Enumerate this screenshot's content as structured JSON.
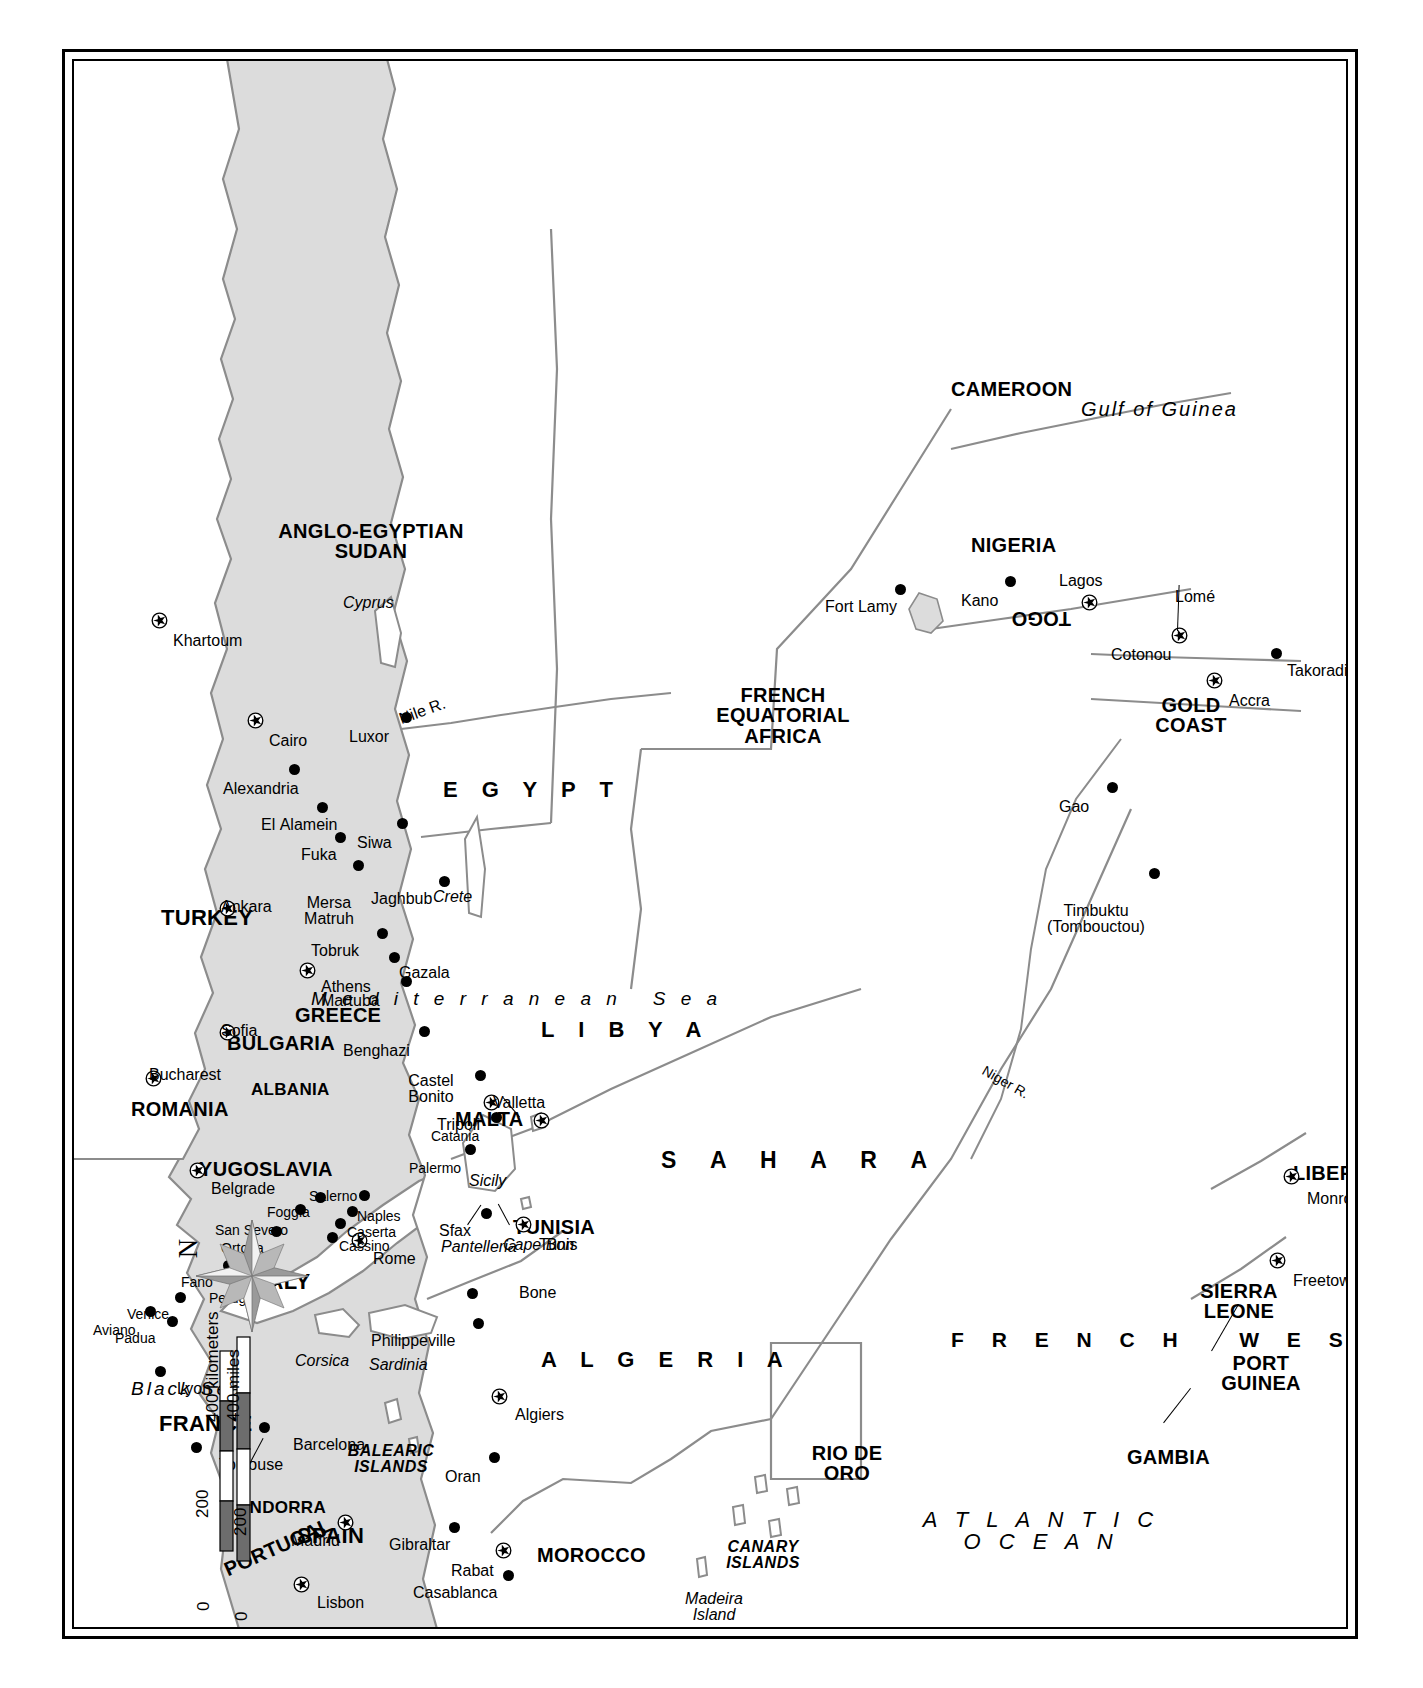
{
  "map": {
    "title": "North Africa and the Mediterranean Theater",
    "orientation": "rotated 90 degrees counter-clockwise on page",
    "colors": {
      "water": "#dcdcdc",
      "land": "#ffffff",
      "border_line": "#8c8c8c",
      "coast_line": "#8c8c8c",
      "frame": "#000000",
      "ink": "#000000"
    },
    "compass": {
      "north_label": "N",
      "icon": "compass-rose-icon"
    },
    "scale": {
      "km_label": "400 kilometers",
      "km_ticks": [
        "0",
        "200",
        "400"
      ],
      "mi_label": "400 miles",
      "mi_ticks": [
        "0",
        "200",
        "400"
      ]
    },
    "water_bodies": [
      {
        "name": "Black Sea"
      },
      {
        "name": "M e d i t e r r a n e a n   S e a"
      },
      {
        "name": "ATLANTIC OCEAN"
      },
      {
        "name": "Gulf of Guinea"
      },
      {
        "name": "Nile R."
      },
      {
        "name": "Niger R."
      }
    ],
    "deserts": [
      {
        "name": "S A H A R A"
      }
    ],
    "countries": [
      {
        "name": "TURKEY"
      },
      {
        "name": "ROMANIA"
      },
      {
        "name": "BULGARIA"
      },
      {
        "name": "YUGOSLAVIA"
      },
      {
        "name": "ALBANIA"
      },
      {
        "name": "GREECE"
      },
      {
        "name": "ITALY"
      },
      {
        "name": "MALTA"
      },
      {
        "name": "TUNISIA"
      },
      {
        "name": "FRANCE"
      },
      {
        "name": "ANDORRA"
      },
      {
        "name": "SPAIN"
      },
      {
        "name": "PORTUGAL"
      },
      {
        "name": "MOROCCO"
      },
      {
        "name": "ALGERIA"
      },
      {
        "name": "LIBYA"
      },
      {
        "name": "EGYPT"
      },
      {
        "name": "ANGLO-EGYPTIAN SUDAN"
      },
      {
        "name": "FRENCH EQUATORIAL AFRICA"
      },
      {
        "name": "CAMEROON"
      },
      {
        "name": "NIGERIA"
      },
      {
        "name": "FRENCH WEST AFRICA"
      },
      {
        "name": "RIO DE ORO"
      },
      {
        "name": "GAMBIA"
      },
      {
        "name": "PORT GUINEA"
      },
      {
        "name": "SIERRA LEONE"
      },
      {
        "name": "LIBERIA"
      },
      {
        "name": "GOLD COAST"
      },
      {
        "name": "TOGO"
      }
    ],
    "islands": [
      {
        "name": "Cyprus"
      },
      {
        "name": "Crete"
      },
      {
        "name": "Sicily"
      },
      {
        "name": "Corsica"
      },
      {
        "name": "Sardinia"
      },
      {
        "name": "BALEARIC ISLANDS"
      },
      {
        "name": "Pantelleria"
      },
      {
        "name": "Cape Bon"
      },
      {
        "name": "Madeira Island"
      },
      {
        "name": "CANARY ISLANDS"
      }
    ],
    "capitals": [
      {
        "name": "Ankara"
      },
      {
        "name": "Bucharest"
      },
      {
        "name": "Sofia"
      },
      {
        "name": "Belgrade"
      },
      {
        "name": "Athens"
      },
      {
        "name": "Rome"
      },
      {
        "name": "Valletta"
      },
      {
        "name": "Tunis"
      },
      {
        "name": "Algiers"
      },
      {
        "name": "Madrid"
      },
      {
        "name": "Lisbon"
      },
      {
        "name": "Rabat"
      },
      {
        "name": "Tripoli"
      },
      {
        "name": "Cairo"
      },
      {
        "name": "Khartoum"
      },
      {
        "name": "Lagos"
      },
      {
        "name": "Cotonou"
      },
      {
        "name": "Lomé"
      },
      {
        "name": "Accra"
      },
      {
        "name": "Freetown"
      },
      {
        "name": "Monrovia"
      }
    ],
    "cities": [
      {
        "name": "Alexandria"
      },
      {
        "name": "El Alamein"
      },
      {
        "name": "Fuka"
      },
      {
        "name": "Mersa Matruh"
      },
      {
        "name": "Siwa"
      },
      {
        "name": "Tobruk"
      },
      {
        "name": "Gazala"
      },
      {
        "name": "Martuba"
      },
      {
        "name": "Jaghbub"
      },
      {
        "name": "Benghazi"
      },
      {
        "name": "Castel Bonito"
      },
      {
        "name": "Luxor"
      },
      {
        "name": "Sfax"
      },
      {
        "name": "Bone"
      },
      {
        "name": "Philippeville"
      },
      {
        "name": "Oran"
      },
      {
        "name": "Barcelona"
      },
      {
        "name": "Toulouse"
      },
      {
        "name": "Lyon"
      },
      {
        "name": "Gibraltar"
      },
      {
        "name": "Casablanca"
      },
      {
        "name": "Aviano"
      },
      {
        "name": "Padua"
      },
      {
        "name": "Venice"
      },
      {
        "name": "Fano"
      },
      {
        "name": "Perugia"
      },
      {
        "name": "Ortona"
      },
      {
        "name": "San Severo"
      },
      {
        "name": "Foggia"
      },
      {
        "name": "Salerno"
      },
      {
        "name": "Naples"
      },
      {
        "name": "Caserta"
      },
      {
        "name": "Cassino"
      },
      {
        "name": "Palermo"
      },
      {
        "name": "Catania"
      },
      {
        "name": "Fort Lamy"
      },
      {
        "name": "Kano"
      },
      {
        "name": "Gao"
      },
      {
        "name": "Timbuktu (Tombouctou)"
      },
      {
        "name": "Takoradi"
      }
    ],
    "labels": {
      "black_sea": "Black Sea",
      "med_sea": "M e d i t e r r a n e a n   S e a",
      "atlantic": "A T L A N T I C\nO C E A N",
      "gulf_guinea": "Gulf of Guinea",
      "nile": "Nile R.",
      "niger": "Niger R.",
      "sahara": "S A H A R A",
      "turkey": "TURKEY",
      "romania": "ROMANIA",
      "bulgaria": "BULGARIA",
      "yugoslavia": "YUGOSLAVIA",
      "albania": "ALBANIA",
      "greece": "GREECE",
      "italy": "ITALY",
      "malta": "MALTA",
      "tunisia": "TUNISIA",
      "france": "FRANCE",
      "andorra": "ANDORRA",
      "spain": "SPAIN",
      "portugal": "PORTUGAL",
      "morocco": "MOROCCO",
      "algeria": "A L G E R I A",
      "libya": "L I B Y A",
      "egypt": "E G Y P T",
      "sudan": "ANGLO-EGYPTIAN\nSUDAN",
      "fea": "FRENCH\nEQUATORIAL\nAFRICA",
      "cameroon": "CAMEROON",
      "nigeria": "NIGERIA",
      "fwa": "F R E N C H   W E S T   A F R I C A",
      "rio_de_oro": "RIO DE\nORO",
      "gambia": "GAMBIA",
      "port_guinea": "PORT\nGUINEA",
      "sierra_leone": "SIERRA\nLEONE",
      "liberia": "LIBERIA",
      "gold_coast": "GOLD\nCOAST",
      "togo": "TOGO",
      "cyprus": "Cyprus",
      "crete": "Crete",
      "sicily": "Sicily",
      "corsica": "Corsica",
      "sardinia": "Sardinia",
      "balearic": "BALEARIC\nISLANDS",
      "pantelleria": "Pantelleria",
      "cape_bon": "Cape Bon",
      "madeira": "Madeira\nIsland",
      "canary": "CANARY\nISLANDS",
      "ankara": "Ankara",
      "bucharest": "Bucharest",
      "sofia": "Sofia",
      "belgrade": "Belgrade",
      "athens": "Athens",
      "rome": "Rome",
      "valletta": "Valletta",
      "tunis": "Tunis",
      "algiers": "Algiers",
      "madrid": "Madrid",
      "lisbon": "Lisbon",
      "rabat": "Rabat",
      "tripoli": "Tripoli",
      "cairo": "Cairo",
      "khartoum": "Khartoum",
      "lagos": "Lagos",
      "cotonou": "Cotonou",
      "lome": "Lomé",
      "accra": "Accra",
      "freetown": "Freetown",
      "monrovia": "Monrovia",
      "alexandria": "Alexandria",
      "el_alamein": "El Alamein",
      "fuka": "Fuka",
      "mersa_matruh": "Mersa\nMatruh",
      "siwa": "Siwa",
      "tobruk": "Tobruk",
      "gazala": "Gazala",
      "martuba": "Martuba",
      "jaghbub": "Jaghbub",
      "benghazi": "Benghazi",
      "castel_bonito": "Castel\nBonito",
      "luxor": "Luxor",
      "sfax": "Sfax",
      "bone": "Bone",
      "philippeville": "Philippeville",
      "oran": "Oran",
      "barcelona": "Barcelona",
      "toulouse": "Toulouse",
      "lyon": "Lyon",
      "gibraltar": "Gibraltar",
      "casablanca": "Casablanca",
      "aviano": "Aviano",
      "padua": "Padua",
      "venice": "Venice",
      "fano": "Fano",
      "perugia": "Perugia",
      "ortona": "Ortona",
      "san_severo": "San Severo",
      "foggia": "Foggia",
      "salerno": "Salerno",
      "naples": "Naples",
      "caserta": "Caserta",
      "cassino": "Cassino",
      "palermo": "Palermo",
      "catania": "Catania",
      "fort_lamy": "Fort Lamy",
      "kano": "Kano",
      "gao": "Gao",
      "timbuktu": "Timbuktu\n(Tombouctou)",
      "takoradi": "Takoradi",
      "north": "N",
      "scale_km": "400 kilometers",
      "scale_mi": "400 miles",
      "scale_0a": "0",
      "scale_200a": "200",
      "scale_0b": "0",
      "scale_200b": "200"
    }
  }
}
